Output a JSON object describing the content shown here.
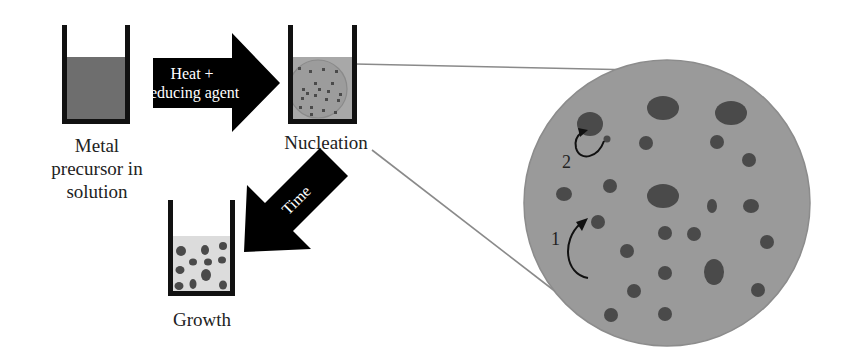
{
  "diagram": {
    "type": "process-flow",
    "colors": {
      "background": "#ffffff",
      "beaker_wall": "#111111",
      "precursor_solution": "#6e6e6e",
      "nucleation_solution": "#a8a8a8",
      "growth_solution": "#dcdcdc",
      "particle": "#4a4a4a",
      "zoom_circle_fill": "#9a9a9a",
      "connector_line": "#8a8a8a",
      "arrow_fill": "#000000",
      "arrow_text": "#ffffff"
    },
    "stages": [
      {
        "id": "precursor",
        "label_lines": [
          "Metal",
          "precursor in",
          "solution"
        ]
      },
      {
        "id": "nucleation",
        "label": "Nucleation"
      },
      {
        "id": "growth",
        "label": "Growth"
      }
    ],
    "arrows": [
      {
        "id": "heat-arrow",
        "label_lines": [
          "Heat +",
          "reducing agent"
        ],
        "from": "precursor",
        "to": "nucleation"
      },
      {
        "id": "time-arrow",
        "label": "Time",
        "from": "nucleation",
        "to": "growth"
      }
    ],
    "zoom_view": {
      "of": "nucleation",
      "annotations": [
        {
          "id": "step-1",
          "label": "1"
        },
        {
          "id": "step-2",
          "label": "2"
        }
      ]
    }
  }
}
